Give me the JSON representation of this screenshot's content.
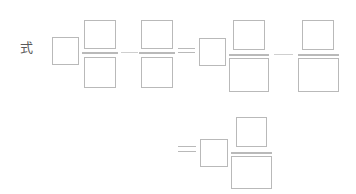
{
  "canvas": {
    "width": 356,
    "height": 194,
    "background": "#ffffff",
    "stroke_color": "#b9b9b9",
    "faint_stroke_color": "#cfcfcf",
    "text_color": "#5a5a5a"
  },
  "label": {
    "text": "式",
    "meaning": "formula-expression-label",
    "x": 20,
    "y": 41
  },
  "row1": {
    "name": "equation-row-1",
    "term1_box": {
      "x": 52,
      "y": 37,
      "w": 27,
      "h": 28,
      "value": ""
    },
    "fraction1": {
      "numerator": {
        "x": 84,
        "y": 20,
        "w": 32,
        "h": 29,
        "value": ""
      },
      "bar": {
        "x": 82,
        "y": 52,
        "w": 36
      },
      "denominator": {
        "x": 84,
        "y": 57,
        "w": 32,
        "h": 31,
        "value": ""
      }
    },
    "connector1": {
      "type": "dash",
      "x": 121,
      "y": 52,
      "w": 17
    },
    "fraction2": {
      "numerator": {
        "x": 141,
        "y": 20,
        "w": 32,
        "h": 29,
        "value": ""
      },
      "bar": {
        "x": 139,
        "y": 52,
        "w": 36
      },
      "denominator": {
        "x": 141,
        "y": 57,
        "w": 32,
        "h": 31,
        "value": ""
      }
    },
    "equals1": {
      "type": "equals",
      "x": 178,
      "y": 48,
      "w": 17,
      "h": 5
    },
    "term2_box": {
      "x": 199,
      "y": 38,
      "w": 27,
      "h": 28,
      "value": ""
    },
    "fraction3": {
      "numerator": {
        "x": 233,
        "y": 20,
        "w": 32,
        "h": 30,
        "value": ""
      },
      "bar": {
        "x": 229,
        "y": 54,
        "w": 40
      },
      "denominator": {
        "x": 229,
        "y": 58,
        "w": 40,
        "h": 34,
        "value": ""
      }
    },
    "connector2": {
      "type": "dash",
      "x": 274,
      "y": 54,
      "w": 19
    },
    "fraction4": {
      "numerator": {
        "x": 302,
        "y": 20,
        "w": 32,
        "h": 30,
        "value": ""
      },
      "bar": {
        "x": 298,
        "y": 54,
        "w": 41
      },
      "denominator": {
        "x": 298,
        "y": 58,
        "w": 41,
        "h": 34,
        "value": ""
      }
    }
  },
  "row2": {
    "name": "equation-row-2",
    "equals1": {
      "type": "equals",
      "x": 178,
      "y": 146,
      "w": 18,
      "h": 6
    },
    "term1_box": {
      "x": 200,
      "y": 139,
      "w": 28,
      "h": 28,
      "value": ""
    },
    "fraction1": {
      "numerator": {
        "x": 236,
        "y": 117,
        "w": 31,
        "h": 30,
        "value": ""
      },
      "bar": {
        "x": 231,
        "y": 152,
        "w": 41
      },
      "denominator": {
        "x": 231,
        "y": 156,
        "w": 41,
        "h": 33,
        "value": ""
      }
    }
  }
}
